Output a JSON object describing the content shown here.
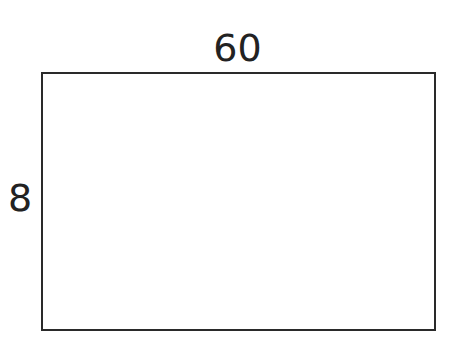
{
  "diagram": {
    "shape": "rectangle",
    "top_label": "60",
    "left_label": "8",
    "stroke_color": "#2a2a2a",
    "fill_color": "#ffffff"
  }
}
